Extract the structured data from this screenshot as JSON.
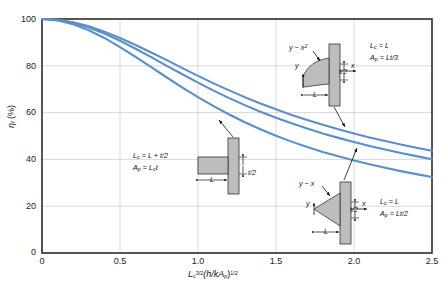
{
  "chart_data": {
    "type": "line",
    "title": "",
    "xlabel": "Lc^(3/2)(h/kAp)^(1/2)",
    "ylabel": "ηf (%)",
    "xlim": [
      0,
      2.5
    ],
    "ylim": [
      0,
      100
    ],
    "xticks": [
      "0",
      "0.5",
      "1.0",
      "1.5",
      "2.0",
      "2.5"
    ],
    "yticks": [
      "0",
      "20",
      "40",
      "60",
      "80",
      "100"
    ],
    "grid": true,
    "legend": "none",
    "line_color": "#5b8fc9",
    "series": [
      {
        "name": "Rectangular",
        "x": [
          0,
          0.1,
          0.2,
          0.3,
          0.4,
          0.5,
          0.6,
          0.7,
          0.8,
          0.9,
          1.0,
          1.1,
          1.2,
          1.3,
          1.4,
          1.5,
          1.6,
          1.7,
          1.8,
          1.9,
          2.0,
          2.1,
          2.2,
          2.3,
          2.4,
          2.5
        ],
        "values": [
          100,
          99.7,
          98.6,
          96.9,
          94.6,
          91.9,
          88.9,
          85.7,
          82.4,
          79.0,
          75.7,
          72.5,
          69.5,
          66.6,
          63.9,
          61.4,
          59.0,
          56.8,
          54.8,
          52.9,
          51.1,
          49.4,
          47.9,
          46.4,
          45.0,
          43.7
        ]
      },
      {
        "name": "Triangular",
        "x": [
          0,
          0.1,
          0.2,
          0.3,
          0.4,
          0.5,
          0.6,
          0.7,
          0.8,
          0.9,
          1.0,
          1.1,
          1.2,
          1.3,
          1.4,
          1.5,
          1.6,
          1.7,
          1.8,
          1.9,
          2.0,
          2.1,
          2.2,
          2.3,
          2.4,
          2.5
        ],
        "values": [
          100,
          99.6,
          98.4,
          96.4,
          93.8,
          90.7,
          87.3,
          83.7,
          80.0,
          76.4,
          72.8,
          69.4,
          66.2,
          63.2,
          60.4,
          57.8,
          55.4,
          53.2,
          51.1,
          49.2,
          47.4,
          45.7,
          44.2,
          42.7,
          41.4,
          40.1
        ]
      },
      {
        "name": "Parabolic",
        "x": [
          0,
          0.1,
          0.2,
          0.3,
          0.4,
          0.5,
          0.6,
          0.7,
          0.8,
          0.9,
          1.0,
          1.1,
          1.2,
          1.3,
          1.4,
          1.5,
          1.6,
          1.7,
          1.8,
          1.9,
          2.0,
          2.1,
          2.2,
          2.3,
          2.4,
          2.5
        ],
        "values": [
          100,
          99.4,
          97.8,
          95.2,
          91.9,
          88.0,
          83.8,
          79.4,
          75.0,
          70.7,
          66.6,
          62.8,
          59.2,
          55.9,
          52.9,
          50.1,
          47.6,
          45.3,
          43.2,
          41.3,
          39.5,
          37.9,
          36.4,
          35.0,
          33.7,
          32.5
        ]
      }
    ]
  },
  "axes": {
    "ylabel_eta": "η",
    "ylabel_sub": "f",
    "ylabel_unit": " (%)",
    "xlabel_L": "L",
    "xlabel_Lsub": "c",
    "xlabel_Lsup": "3/2",
    "xlabel_mid": "(h/kA",
    "xlabel_psub": "p",
    "xlabel_close": ")",
    "xlabel_sup2": "1/2",
    "yticks": [
      "100",
      "80",
      "60",
      "40",
      "20",
      "0"
    ],
    "xticks": [
      "0",
      "0.5",
      "1.0",
      "1.5",
      "2.0",
      "2.5"
    ]
  },
  "insets": {
    "rectangular": {
      "lc_line": "L",
      "lc_sub": "c",
      "lc_eq": " = L + t/2",
      "ap_line": "A",
      "ap_sub": "p",
      "ap_eq": " = L",
      "ap_sub2": "c",
      "ap_tail": "t",
      "dim_L": "L",
      "dim_t": "t/2"
    },
    "parabolic": {
      "profile": "y ~ x",
      "profile_sup": "2",
      "axis_y": "y",
      "axis_x": "x",
      "lc_line": "L",
      "lc_sub": "c",
      "lc_eq": " = L",
      "ap_line": "A",
      "ap_sub": "p",
      "ap_eq": " = Lt/3",
      "dim_L": "L",
      "dim_t": "t/2"
    },
    "triangular": {
      "profile": "y ~ x",
      "axis_y": "y",
      "axis_x": "x",
      "lc_line": "L",
      "lc_sub": "c",
      "lc_eq": " = L",
      "ap_line": "A",
      "ap_sub": "p",
      "ap_eq": " = Lt/2",
      "dim_L": "L",
      "dim_t": "t/2"
    }
  }
}
